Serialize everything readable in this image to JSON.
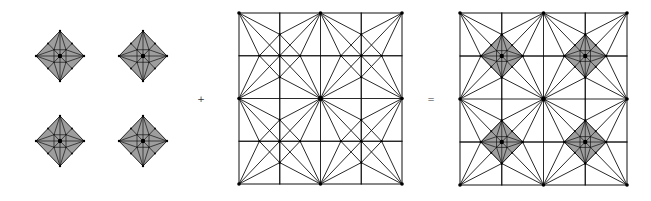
{
  "figure": {
    "colors": {
      "background": "#ffffff",
      "line": "#111111",
      "diamond_fill": "#9e9e9e",
      "node": "#000000"
    },
    "operators": {
      "plus": "+",
      "equals": "="
    },
    "left_panel": {
      "label": "diamond-tiles",
      "diamond_half_width": 24,
      "diamond_half_height": 25,
      "centers": [
        [
          60,
          56
        ],
        [
          143,
          56
        ],
        [
          60,
          141
        ],
        [
          143,
          141
        ]
      ]
    },
    "middle_panel": {
      "label": "triangulated-grid",
      "x": 239,
      "y": 13,
      "width": 163,
      "height": 171,
      "grid_cells": 4
    },
    "right_panel": {
      "label": "combined-pattern",
      "x": 460,
      "y": 13,
      "width": 167,
      "height": 172,
      "grid_cells": 4
    },
    "operator_positions": {
      "plus": [
        201,
        99
      ],
      "equals": [
        431,
        99
      ]
    }
  }
}
